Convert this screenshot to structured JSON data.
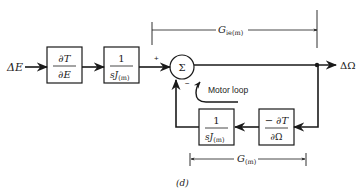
{
  "diagram": {
    "input_label": "ΔE",
    "output_label": "ΔΩ",
    "blocks": [
      {
        "id": "dT_dE",
        "num": "∂T",
        "den": "∂E"
      },
      {
        "id": "inv_sJ_forward",
        "num": "1",
        "den_main": "sJ",
        "den_sub": "(m)"
      },
      {
        "id": "inv_sJ_feedback",
        "num": "1",
        "den_main": "sJ",
        "den_sub": "(m)"
      },
      {
        "id": "neg_dT_dOmega",
        "num": "− ∂T",
        "den": "∂Ω"
      }
    ],
    "summing_junction": {
      "symbol": "Σ",
      "plus_sign": "+",
      "minus_sign": "−"
    },
    "loop_label": "Motor loop",
    "bracket_top": {
      "main": "G",
      "sub": "ie(m)"
    },
    "bracket_bottom": {
      "main": "G",
      "sub": "(m)"
    },
    "caption": "(d)"
  },
  "colors": {
    "ink": "#1a1a1a",
    "background": "#ffffff"
  }
}
